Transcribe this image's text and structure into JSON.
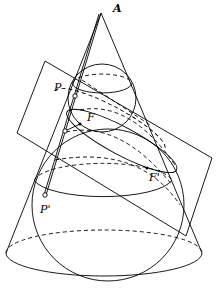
{
  "diagram": {
    "labels": {
      "apex": "A",
      "point_upper": "P",
      "focus_upper": "F",
      "focus_lower": "F'",
      "point_lower": "P'"
    },
    "colors": {
      "stroke": "#000000",
      "background": "#ffffff"
    }
  }
}
